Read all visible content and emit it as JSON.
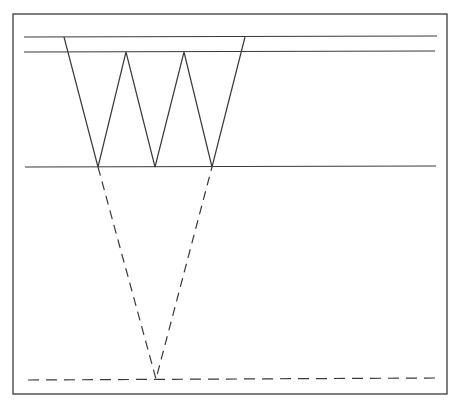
{
  "diagram": {
    "width": 458,
    "height": 406,
    "background": "#ffffff",
    "stroke_color": "#3a3a3a",
    "frame": {
      "x": 13,
      "y": 14,
      "w": 434,
      "h": 380
    },
    "horizontal_lines": [
      {
        "name": "top-line-1",
        "x1": 24,
        "y1": 37,
        "x2": 437,
        "y2": 36,
        "style": "solid"
      },
      {
        "name": "top-line-2",
        "x1": 24,
        "y1": 52,
        "x2": 435,
        "y2": 51,
        "style": "solid"
      },
      {
        "name": "middle-line",
        "x1": 25,
        "y1": 167,
        "x2": 436,
        "y2": 166,
        "style": "solid"
      },
      {
        "name": "bottom-dashed-line",
        "x1": 28,
        "y1": 380,
        "x2": 437,
        "y2": 378,
        "style": "dashed"
      }
    ],
    "zigzag": {
      "points": "64,37 98,167 126,52 155,167 184,52 212,167 245,37",
      "style": "solid"
    },
    "dashed_v": {
      "points": "98,167 156,379 212,167",
      "style": "dashed"
    }
  }
}
